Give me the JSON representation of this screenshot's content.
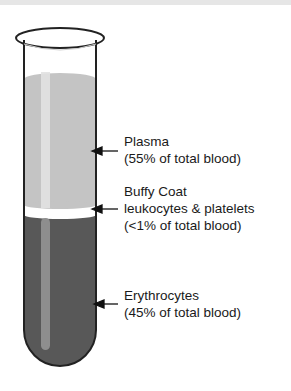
{
  "diagram": {
    "layers": [
      {
        "name": "Plasma",
        "line2": "(55% of total blood)",
        "color": "#c4c4c4"
      },
      {
        "name": "Buffy Coat",
        "line2": "leukocytes & platelets",
        "line3": "(<1% of total blood)",
        "color": "#ffffff"
      },
      {
        "name": "Erythrocytes",
        "line2": "(45% of total blood)",
        "color": "#585858"
      }
    ]
  }
}
